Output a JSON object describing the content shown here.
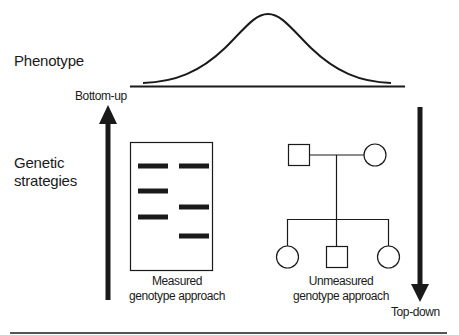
{
  "diagram": {
    "phenotype_label": "Phenotype",
    "genetic_strategies_label": [
      "Genetic",
      "strategies"
    ],
    "bottom_up_label": "Bottom-up",
    "top_down_label": "Top-down",
    "measured_label": [
      "Measured",
      "genotype approach"
    ],
    "unmeasured_label": [
      "Unmeasured",
      "genotype approach"
    ],
    "gel_bands": {
      "left_lane_y": [
        166,
        191,
        217
      ],
      "right_lane_y": [
        166,
        207,
        236
      ]
    },
    "pedigree": {
      "parents": [
        "male-square",
        "female-circle"
      ],
      "children": [
        "female-circle",
        "male-square",
        "female-circle"
      ]
    },
    "colors": {
      "stroke": "#1a1a1a",
      "background": "#ffffff"
    }
  }
}
